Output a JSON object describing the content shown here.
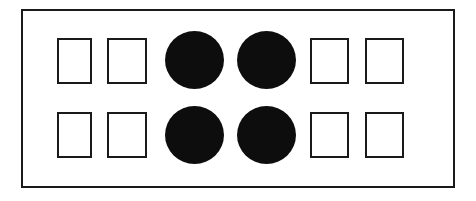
{
  "figure": {
    "canvas": {
      "width": 476,
      "height": 201,
      "background_color": "#ffffff"
    },
    "frame": {
      "name": "outer-rectangle",
      "x": 21,
      "y": 9,
      "width": 434,
      "height": 179,
      "stroke_color": "#1a1a1a",
      "stroke_width": 2,
      "fill_color": "#ffffff"
    },
    "colors": {
      "outline": "#1a1a1a",
      "fill_solid": "#0d0d0d",
      "fill_empty": "#ffffff",
      "background": "#ffffff"
    },
    "counts": {
      "rows": 2,
      "columns": 6,
      "total_shapes": 12,
      "squares": 8,
      "circles": 4
    },
    "shapes": [
      {
        "id": "row1-col1",
        "kind": "square",
        "row": 1,
        "column": 1,
        "filled": false,
        "x": 57,
        "y": 38,
        "width": 35,
        "height": 46
      },
      {
        "id": "row1-col2",
        "kind": "square",
        "row": 1,
        "column": 2,
        "filled": false,
        "x": 107,
        "y": 38,
        "width": 40,
        "height": 46
      },
      {
        "id": "row1-col3",
        "kind": "circle",
        "row": 1,
        "column": 3,
        "filled": true,
        "x": 165,
        "y": 31,
        "width": 59,
        "height": 58
      },
      {
        "id": "row1-col4",
        "kind": "circle",
        "row": 1,
        "column": 4,
        "filled": true,
        "x": 237,
        "y": 31,
        "width": 59,
        "height": 58
      },
      {
        "id": "row1-col5",
        "kind": "square",
        "row": 1,
        "column": 5,
        "filled": false,
        "x": 310,
        "y": 38,
        "width": 39,
        "height": 46
      },
      {
        "id": "row1-col6",
        "kind": "square",
        "row": 1,
        "column": 6,
        "filled": false,
        "x": 365,
        "y": 38,
        "width": 39,
        "height": 46
      },
      {
        "id": "row2-col1",
        "kind": "square",
        "row": 2,
        "column": 1,
        "filled": false,
        "x": 57,
        "y": 112,
        "width": 35,
        "height": 46
      },
      {
        "id": "row2-col2",
        "kind": "square",
        "row": 2,
        "column": 2,
        "filled": false,
        "x": 107,
        "y": 112,
        "width": 40,
        "height": 46
      },
      {
        "id": "row2-col3",
        "kind": "circle",
        "row": 2,
        "column": 3,
        "filled": true,
        "x": 165,
        "y": 106,
        "width": 59,
        "height": 58
      },
      {
        "id": "row2-col4",
        "kind": "circle",
        "row": 2,
        "column": 4,
        "filled": true,
        "x": 237,
        "y": 106,
        "width": 59,
        "height": 58
      },
      {
        "id": "row2-col5",
        "kind": "square",
        "row": 2,
        "column": 5,
        "filled": false,
        "x": 310,
        "y": 112,
        "width": 39,
        "height": 46
      },
      {
        "id": "row2-col6",
        "kind": "square",
        "row": 2,
        "column": 6,
        "filled": false,
        "x": 365,
        "y": 112,
        "width": 39,
        "height": 46
      }
    ]
  }
}
